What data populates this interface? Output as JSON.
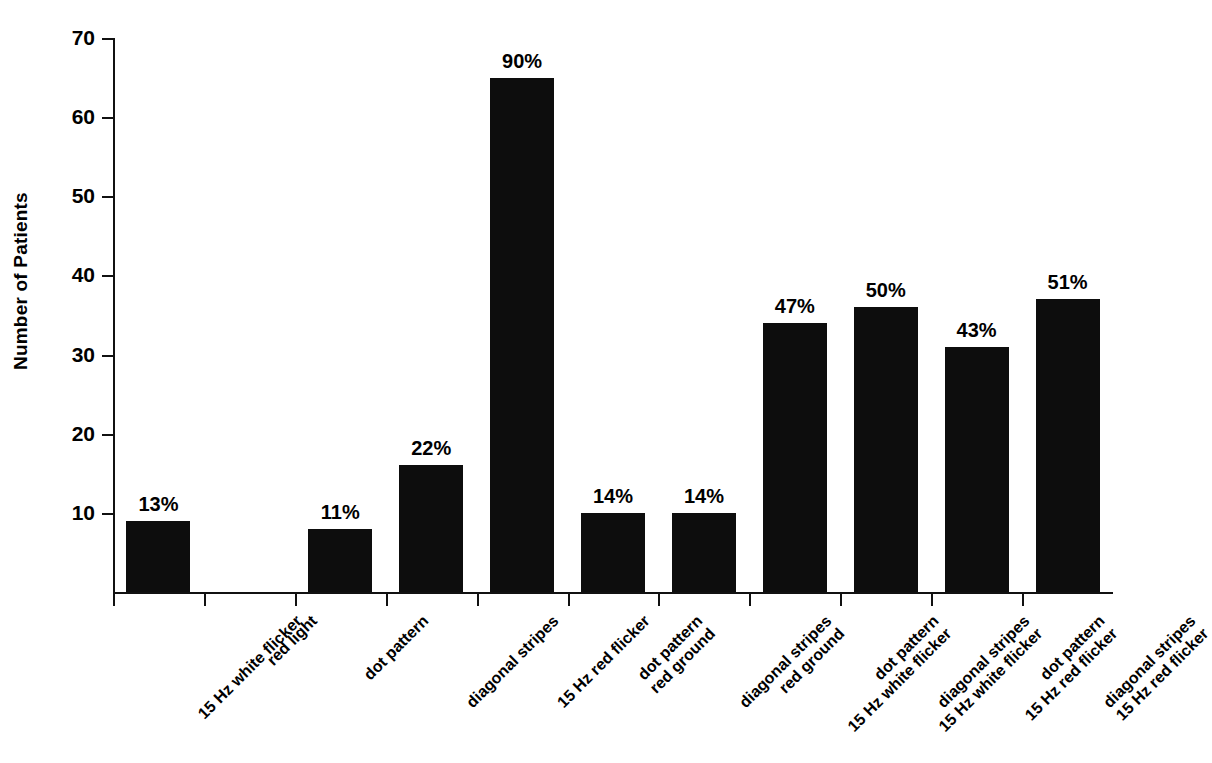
{
  "chart_data": {
    "type": "bar",
    "title": "",
    "subtitle": "",
    "xlabel": "",
    "ylabel": "Number of Patients",
    "ylim": [
      0,
      70
    ],
    "yticks": [
      0,
      10,
      20,
      30,
      40,
      50,
      60,
      70
    ],
    "ytick_labels": [
      "",
      "10",
      "20",
      "30",
      "40",
      "50",
      "60",
      "70"
    ],
    "grid": false,
    "legend": "none",
    "bar_color": "#0d0d0d",
    "categories": [
      "15 Hz white flicker",
      "red light",
      "dot pattern",
      "diagonal stripes",
      "15 Hz red flicker",
      "dot pattern red ground",
      "diagonal stripes red ground",
      "dot pattern 15 Hz white flicker",
      "diagonal stripes 15 Hz white flicker",
      "dot pattern 15 Hz red flicker",
      "diagonal stripes 15 Hz red flicker"
    ],
    "category_lines": [
      [
        "15 Hz white flicker",
        ""
      ],
      [
        "red light",
        ""
      ],
      [
        "dot pattern",
        ""
      ],
      [
        "diagonal stripes",
        ""
      ],
      [
        "15 Hz red flicker",
        ""
      ],
      [
        "dot pattern",
        "red ground"
      ],
      [
        "diagonal stripes",
        "red ground"
      ],
      [
        "dot pattern",
        "15 Hz white flicker"
      ],
      [
        "diagonal stripes",
        "15 Hz white flicker"
      ],
      [
        "dot pattern",
        "15 Hz red flicker"
      ],
      [
        "diagonal stripes",
        "15 Hz red flicker"
      ]
    ],
    "values": [
      9,
      0,
      8,
      16,
      65,
      10,
      10,
      34,
      36,
      31,
      37
    ],
    "data_labels": [
      "13%",
      "",
      "11%",
      "22%",
      "90%",
      "14%",
      "14%",
      "47%",
      "50%",
      "43%",
      "51%"
    ]
  }
}
